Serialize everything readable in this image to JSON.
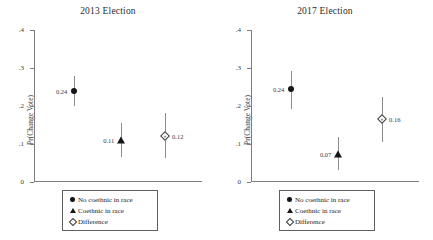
{
  "chart_data": {
    "type": "scatter",
    "title": "",
    "xlabel": "",
    "ylabel": "Pr(Change Vote)",
    "ylim": [
      0,
      0.4
    ],
    "yticks": [
      "0",
      ".1",
      ".2",
      ".3",
      ".4"
    ],
    "ytick_values": [
      0,
      0.1,
      0.2,
      0.3,
      0.4
    ],
    "grid": false,
    "legend_position": "bottom-center",
    "legend": [
      {
        "label": "No coethnic in race",
        "marker": "filled-circle"
      },
      {
        "label": "Coethnic in race",
        "marker": "filled-triangle"
      },
      {
        "label": "Difference",
        "marker": "open-diamond"
      }
    ],
    "panels": [
      {
        "title": "2013 Election",
        "points": [
          {
            "name": "No coethnic in race",
            "marker": "filled-circle",
            "value": 0.24,
            "label": "0.24",
            "label_side": "left",
            "ci_low": 0.2,
            "ci_high": 0.28,
            "x_pos": 0.24
          },
          {
            "name": "Coethnic in race",
            "marker": "filled-triangle",
            "value": 0.11,
            "label": "0.11",
            "label_side": "left",
            "ci_low": 0.065,
            "ci_high": 0.155,
            "x_pos": 0.52
          },
          {
            "name": "Difference",
            "marker": "open-diamond",
            "value": 0.12,
            "label": "0.12",
            "label_side": "right",
            "ci_low": 0.062,
            "ci_high": 0.182,
            "x_pos": 0.78
          }
        ]
      },
      {
        "title": "2017 Election",
        "points": [
          {
            "name": "No coethnic in race",
            "marker": "filled-circle",
            "value": 0.245,
            "label": "0.24",
            "label_side": "left",
            "ci_low": 0.192,
            "ci_high": 0.292,
            "x_pos": 0.24
          },
          {
            "name": "Coethnic in race",
            "marker": "filled-triangle",
            "value": 0.075,
            "label": "0.07",
            "label_side": "left",
            "ci_low": 0.032,
            "ci_high": 0.118,
            "x_pos": 0.52
          },
          {
            "name": "Difference",
            "marker": "open-diamond",
            "value": 0.165,
            "label": "0.16",
            "label_side": "right",
            "ci_low": 0.104,
            "ci_high": 0.225,
            "x_pos": 0.78
          }
        ]
      }
    ]
  }
}
